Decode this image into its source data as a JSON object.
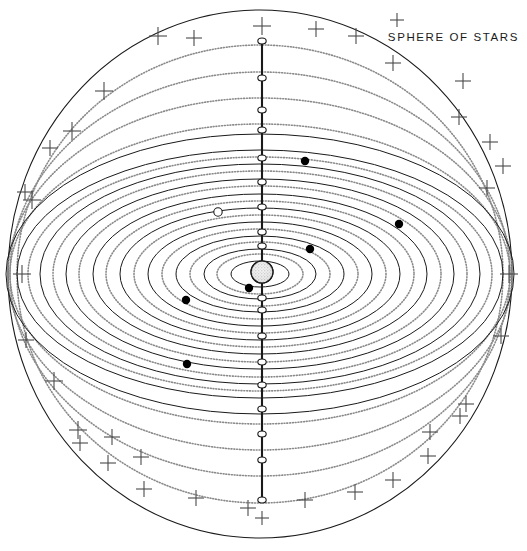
{
  "figure": {
    "title": "SPHERE OF STARS",
    "kind": "orrery-diagram",
    "width": 527,
    "height": 551,
    "background_color": "#ffffff",
    "line_color": "#1a1a1a",
    "dotted_color": "#8a8a8a",
    "star_color": "#4a4a4a",
    "planet_fill": "#000000",
    "node_fill": "#ffffff"
  },
  "sphere_of_stars": {
    "label": "SPHERE OF STARS",
    "cx": 260,
    "cy": 274,
    "rx": 252,
    "ry": 264,
    "stroke_width": 1.1
  },
  "central_body": {
    "name": "central-sun",
    "cx": 262,
    "cy": 272,
    "r": 11,
    "texture": "stippled"
  },
  "polar_axis": {
    "name": "polar-axis",
    "x": 262,
    "y_top": 41,
    "y_bottom": 500,
    "stroke_width": 2.1
  },
  "solid_orbits": [
    {
      "rx": 29,
      "ry": 13
    },
    {
      "rx": 56,
      "ry": 25
    },
    {
      "rx": 84,
      "ry": 38
    },
    {
      "rx": 112,
      "ry": 52
    },
    {
      "rx": 140,
      "ry": 66
    },
    {
      "rx": 167,
      "ry": 80
    },
    {
      "rx": 194,
      "ry": 95
    },
    {
      "rx": 220,
      "ry": 110
    },
    {
      "rx": 243,
      "ry": 124
    },
    {
      "rx": 254,
      "ry": 140
    }
  ],
  "dotted_orbits": [
    {
      "rx": 43,
      "ry": 20
    },
    {
      "rx": 70,
      "ry": 32
    },
    {
      "rx": 98,
      "ry": 45
    },
    {
      "rx": 126,
      "ry": 59
    },
    {
      "rx": 154,
      "ry": 73
    },
    {
      "rx": 181,
      "ry": 88
    },
    {
      "rx": 207,
      "ry": 103
    },
    {
      "rx": 232,
      "ry": 117
    },
    {
      "rx": 250,
      "ry": 150
    },
    {
      "rx": 252,
      "ry": 176
    },
    {
      "rx": 250,
      "ry": 202
    },
    {
      "rx": 243,
      "ry": 229
    }
  ],
  "axis_nodes": [
    {
      "y": 41
    },
    {
      "y": 78
    },
    {
      "y": 110
    },
    {
      "y": 130
    },
    {
      "y": 158
    },
    {
      "y": 182
    },
    {
      "y": 207
    },
    {
      "y": 232
    },
    {
      "y": 246
    },
    {
      "y": 298
    },
    {
      "y": 310
    },
    {
      "y": 336
    },
    {
      "y": 362
    },
    {
      "y": 385
    },
    {
      "y": 409
    },
    {
      "y": 434
    },
    {
      "y": 460
    },
    {
      "y": 500
    }
  ],
  "planets": [
    {
      "name": "planet-upper-right",
      "cx": 305,
      "cy": 161,
      "r": 4.2,
      "style": "filled"
    },
    {
      "name": "planet-right-outer",
      "cx": 399,
      "cy": 224,
      "r": 4.2,
      "style": "filled"
    },
    {
      "name": "planet-right-mid",
      "cx": 310,
      "cy": 249,
      "r": 4.2,
      "style": "filled"
    },
    {
      "name": "planet-inner-lower",
      "cx": 249,
      "cy": 288,
      "r": 4.2,
      "style": "filled"
    },
    {
      "name": "planet-lower-left",
      "cx": 186,
      "cy": 300,
      "r": 4.2,
      "style": "filled"
    },
    {
      "name": "planet-left-lower",
      "cx": 187,
      "cy": 364,
      "r": 4.2,
      "style": "filled"
    },
    {
      "name": "planet-open-left",
      "cx": 218,
      "cy": 212,
      "r": 4.2,
      "style": "open"
    }
  ],
  "stars": [
    {
      "cx": 262,
      "cy": 26,
      "s": 9
    },
    {
      "cx": 158,
      "cy": 36,
      "s": 9
    },
    {
      "cx": 194,
      "cy": 38,
      "s": 8
    },
    {
      "cx": 316,
      "cy": 29,
      "s": 8
    },
    {
      "cx": 356,
      "cy": 36,
      "s": 8
    },
    {
      "cx": 104,
      "cy": 91,
      "s": 9
    },
    {
      "cx": 393,
      "cy": 63,
      "s": 8
    },
    {
      "cx": 463,
      "cy": 81,
      "s": 8
    },
    {
      "cx": 72,
      "cy": 131,
      "s": 9
    },
    {
      "cx": 50,
      "cy": 148,
      "s": 8
    },
    {
      "cx": 459,
      "cy": 117,
      "s": 8
    },
    {
      "cx": 490,
      "cy": 142,
      "s": 8
    },
    {
      "cx": 25,
      "cy": 192,
      "s": 8
    },
    {
      "cx": 32,
      "cy": 200,
      "s": 9
    },
    {
      "cx": 503,
      "cy": 166,
      "s": 8
    },
    {
      "cx": 487,
      "cy": 188,
      "s": 8
    },
    {
      "cx": 22,
      "cy": 274,
      "s": 9
    },
    {
      "cx": 509,
      "cy": 274,
      "s": 9
    },
    {
      "cx": 26,
      "cy": 340,
      "s": 8
    },
    {
      "cx": 501,
      "cy": 336,
      "s": 8
    },
    {
      "cx": 54,
      "cy": 381,
      "s": 9
    },
    {
      "cx": 466,
      "cy": 404,
      "s": 8
    },
    {
      "cx": 460,
      "cy": 416,
      "s": 8
    },
    {
      "cx": 78,
      "cy": 430,
      "s": 9
    },
    {
      "cx": 112,
      "cy": 437,
      "s": 8
    },
    {
      "cx": 80,
      "cy": 443,
      "s": 8
    },
    {
      "cx": 430,
      "cy": 432,
      "s": 8
    },
    {
      "cx": 108,
      "cy": 463,
      "s": 8
    },
    {
      "cx": 141,
      "cy": 457,
      "s": 8
    },
    {
      "cx": 428,
      "cy": 456,
      "s": 8
    },
    {
      "cx": 144,
      "cy": 489,
      "s": 8
    },
    {
      "cx": 196,
      "cy": 498,
      "s": 8
    },
    {
      "cx": 248,
      "cy": 508,
      "s": 8
    },
    {
      "cx": 305,
      "cy": 500,
      "s": 8
    },
    {
      "cx": 355,
      "cy": 492,
      "s": 8
    },
    {
      "cx": 393,
      "cy": 480,
      "s": 8
    },
    {
      "cx": 397,
      "cy": 20,
      "s": 7
    },
    {
      "cx": 262,
      "cy": 518,
      "s": 7
    }
  ]
}
